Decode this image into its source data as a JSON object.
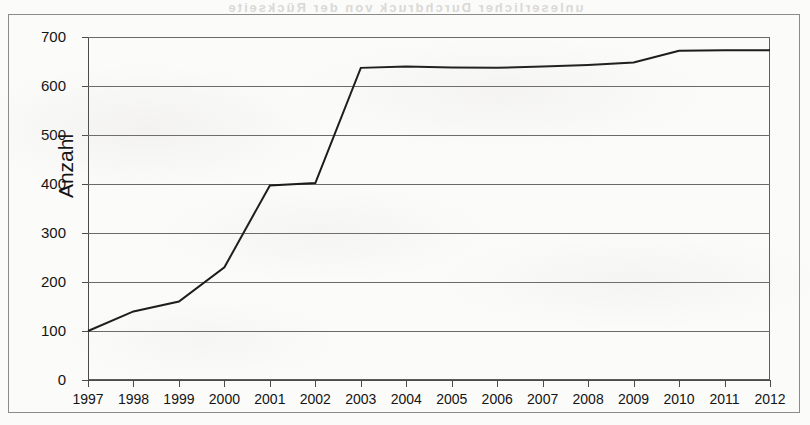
{
  "document": {
    "kind": "scanned-figure",
    "bleed_through_text": "unleserlicher Durchdruck von der Rückseite"
  },
  "chart_data": {
    "type": "line",
    "title": "",
    "subtitle": "",
    "xlabel": "",
    "ylabel": "Anzahl",
    "categories": [
      "1997",
      "1998",
      "1999",
      "2000",
      "2001",
      "2002",
      "2003",
      "2004",
      "2005",
      "2006",
      "2007",
      "2008",
      "2009",
      "2010",
      "2011",
      "2012"
    ],
    "values": [
      100,
      140,
      160,
      230,
      397,
      402,
      637,
      640,
      638,
      637,
      640,
      643,
      648,
      672,
      673,
      673
    ],
    "series": [
      {
        "name": "Anzahl",
        "values": [
          100,
          140,
          160,
          230,
          397,
          402,
          637,
          640,
          638,
          637,
          640,
          643,
          648,
          672,
          673,
          673
        ]
      }
    ],
    "ylim": [
      0,
      700
    ],
    "yticks": [
      0,
      100,
      200,
      300,
      400,
      500,
      600,
      700
    ],
    "ytick_labels": [
      "0",
      "100",
      "200",
      "300",
      "400",
      "500",
      "600",
      "700"
    ],
    "xtick_labels": [
      "1997",
      "1998",
      "1999",
      "2000",
      "2001",
      "2002",
      "2003",
      "2004",
      "2005",
      "2006",
      "2007",
      "2008",
      "2009",
      "2010",
      "2011",
      "2012"
    ],
    "grid": true,
    "grid_axis": "y",
    "legend": false,
    "legend_position": "none",
    "line_color": "#1c1c1c",
    "line_width": 2,
    "markers": false,
    "plot_background": "#ffffff",
    "axis_color": "#4a4a4a",
    "grid_color": "#6a6a6a"
  }
}
